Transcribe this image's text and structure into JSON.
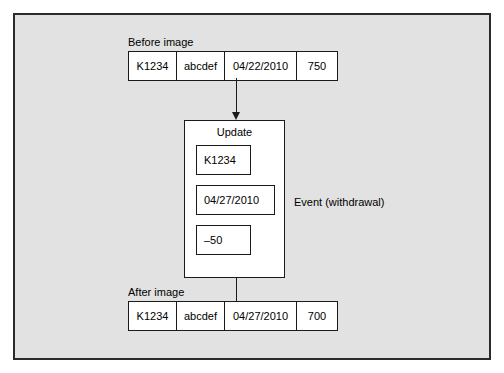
{
  "diagram": {
    "before": {
      "label": "Before image",
      "cells": [
        "K1234",
        "abcdef",
        "04/22/2010",
        "750"
      ]
    },
    "update": {
      "title": "Update",
      "fields": [
        "K1234",
        "04/27/2010",
        "–50"
      ]
    },
    "event": {
      "label": "Event (withdrawal)"
    },
    "after": {
      "label": "After image",
      "cells": [
        "K1234",
        "abcdef",
        "04/27/2010",
        "700"
      ]
    },
    "arrows": [
      {
        "name": "before-to-update"
      },
      {
        "name": "update-to-after"
      }
    ],
    "colors": {
      "background": "#e2e2e2",
      "frame_border": "#2b2b2b",
      "box_border": "#1a1a1a",
      "box_fill": "#ffffff",
      "text": "#000000"
    }
  }
}
